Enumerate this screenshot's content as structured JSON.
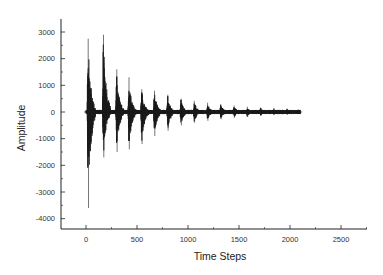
{
  "chart_data": {
    "type": "line",
    "title": "",
    "xlabel": "Time Steps",
    "ylabel": "Amplitude",
    "xlim": [
      -250,
      2750
    ],
    "ylim": [
      -4500,
      3500
    ],
    "xticks": [
      0,
      500,
      1000,
      1500,
      2000,
      2500
    ],
    "xtick_labels": [
      "0",
      "500",
      "1000",
      "1500",
      "2000",
      "2500"
    ],
    "yticks": [
      3000,
      2000,
      1000,
      0,
      -1000,
      -2000,
      -3000,
      -4000
    ],
    "ytick_labels": [
      "3000",
      "2000",
      "1000",
      "0",
      "-1000",
      "-2000",
      "-3000",
      "-4000"
    ],
    "grid": false,
    "legend": null,
    "series": [
      {
        "name": "signal",
        "description": "Decaying periodic bursts of oscillation centered on zero, bursts every ~125 time steps from ~0 to ~2100",
        "signal_end": 2100,
        "burst_period": 125,
        "bursts": [
          {
            "t": 20,
            "max": 2750,
            "min": -3600
          },
          {
            "t": 170,
            "max": 2900,
            "min": -1700
          },
          {
            "t": 300,
            "max": 1600,
            "min": -1500
          },
          {
            "t": 420,
            "max": 1300,
            "min": -1400
          },
          {
            "t": 545,
            "max": 850,
            "min": -1200
          },
          {
            "t": 670,
            "max": 800,
            "min": -900
          },
          {
            "t": 800,
            "max": 650,
            "min": -700
          },
          {
            "t": 930,
            "max": 500,
            "min": -500
          },
          {
            "t": 1060,
            "max": 420,
            "min": -400
          },
          {
            "t": 1190,
            "max": 350,
            "min": -330
          },
          {
            "t": 1320,
            "max": 290,
            "min": -270
          },
          {
            "t": 1450,
            "max": 240,
            "min": -220
          },
          {
            "t": 1580,
            "max": 200,
            "min": -180
          },
          {
            "t": 1710,
            "max": 170,
            "min": -150
          },
          {
            "t": 1840,
            "max": 140,
            "min": -120
          },
          {
            "t": 1970,
            "max": 120,
            "min": -100
          },
          {
            "t": 2080,
            "max": 90,
            "min": -80
          }
        ]
      }
    ]
  }
}
